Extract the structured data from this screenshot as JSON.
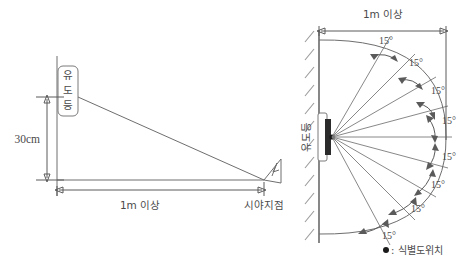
{
  "figure": {
    "colors": {
      "line": "#6e6e6e",
      "wall": "#555555",
      "hatch": "#9a9a9a",
      "text": "#4a4a4a",
      "fixture": "#2b2b2b",
      "background": "#ffffff"
    }
  },
  "side_view": {
    "name": "side-elevation-view",
    "fixture_label": "유도등",
    "fixture_label_chars": [
      "유",
      "도",
      "등"
    ],
    "height_dimension": "30cm",
    "distance_dimension": "1m 이상",
    "view_point_label": "시야지점",
    "eye_icon": "eye-arrow-icon"
  },
  "plan_view": {
    "name": "plan-fan-view",
    "fixture_label": "유도등",
    "distance_dimension": "1m 이상",
    "angle_label": "15°",
    "angle_labels": [
      "15°",
      "15°",
      "15°",
      "15°",
      "15°",
      "15°",
      "15°",
      "15°"
    ],
    "legend": {
      "symbol": "●",
      "separator": ":",
      "text": "식별도위치",
      "full": "● : 식별도위치"
    }
  },
  "chart_data": {
    "type": "diagram",
    "side_view": {
      "vertical_drop_cm": 30,
      "horizontal_distance": "1m 이상",
      "observer": "시야지점"
    },
    "plan_view": {
      "angle_increment_deg": 15,
      "ray_count": 9,
      "total_spread_deg": 120,
      "radius_label": "1m 이상",
      "angles_deg": [
        -60,
        -45,
        -30,
        -15,
        0,
        15,
        30,
        45,
        60
      ],
      "marked_angle_gaps": 8,
      "legend_symbol_meaning": "식별도위치"
    }
  }
}
